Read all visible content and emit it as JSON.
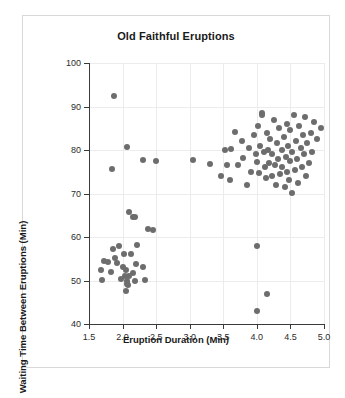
{
  "chart_data": {
    "type": "scatter",
    "title": "Old Faithful Eruptions",
    "xlabel": "Eruption Duration (Min)",
    "ylabel": "Waiting Time Between Eruptions (Min)",
    "xlim": [
      1.5,
      5.0
    ],
    "ylim": [
      40,
      100
    ],
    "xticks": [
      "1.5",
      "2.0",
      "2.5",
      "3.0",
      "3.5",
      "4.0",
      "4.5",
      "5.0"
    ],
    "xtick_values": [
      1.5,
      2.0,
      2.5,
      3.0,
      3.5,
      4.0,
      4.5,
      5.0
    ],
    "yticks": [
      "40",
      "50",
      "60",
      "70",
      "80",
      "90",
      "100"
    ],
    "ytick_values": [
      40,
      50,
      60,
      70,
      80,
      90,
      100
    ],
    "grid": true,
    "legend": "none",
    "marker_color": "#6d6d6d",
    "marker_size": 6,
    "series": [
      {
        "name": "Eruptions",
        "points": [
          [
            1.87,
            92.5
          ],
          [
            1.84,
            75.6
          ],
          [
            2.07,
            80.6
          ],
          [
            2.1,
            65.8
          ],
          [
            2.15,
            64.5
          ],
          [
            2.18,
            64.6
          ],
          [
            2.3,
            77.6
          ],
          [
            2.38,
            61.8
          ],
          [
            2.45,
            61.5
          ],
          [
            2.5,
            77.5
          ],
          [
            3.05,
            77.6
          ],
          [
            1.73,
            54.4
          ],
          [
            1.78,
            54.3
          ],
          [
            1.83,
            51.9
          ],
          [
            1.85,
            57.2
          ],
          [
            1.88,
            55.1
          ],
          [
            1.92,
            54.1
          ],
          [
            1.95,
            58.0
          ],
          [
            1.97,
            50.3
          ],
          [
            2.0,
            53.2
          ],
          [
            2.02,
            56.1
          ],
          [
            2.03,
            51.0
          ],
          [
            2.05,
            47.6
          ],
          [
            2.05,
            52.4
          ],
          [
            2.06,
            49.8
          ],
          [
            2.07,
            49.2
          ],
          [
            2.08,
            48.9
          ],
          [
            2.1,
            51.0
          ],
          [
            2.12,
            56.2
          ],
          [
            2.15,
            51.7
          ],
          [
            2.18,
            49.9
          ],
          [
            2.2,
            53.9
          ],
          [
            2.22,
            58.2
          ],
          [
            2.3,
            53.2
          ],
          [
            2.33,
            50.2
          ],
          [
            1.68,
            52.3
          ],
          [
            1.7,
            50.1
          ],
          [
            3.52,
            79.9
          ],
          [
            3.6,
            73.0
          ],
          [
            3.62,
            80.3
          ],
          [
            3.67,
            84.2
          ],
          [
            3.72,
            76.5
          ],
          [
            3.78,
            82.0
          ],
          [
            3.8,
            78.1
          ],
          [
            3.85,
            72.0
          ],
          [
            3.88,
            80.5
          ],
          [
            3.92,
            75.0
          ],
          [
            3.95,
            83.5
          ],
          [
            3.98,
            79.0
          ],
          [
            4.0,
            77.2
          ],
          [
            4.02,
            85.5
          ],
          [
            4.03,
            74.6
          ],
          [
            4.05,
            81.0
          ],
          [
            4.07,
            88.5
          ],
          [
            4.08,
            88.0
          ],
          [
            4.1,
            79.5
          ],
          [
            4.12,
            76.0
          ],
          [
            4.13,
            73.5
          ],
          [
            4.15,
            84.0
          ],
          [
            4.17,
            80.0
          ],
          [
            4.18,
            77.0
          ],
          [
            4.2,
            82.5
          ],
          [
            4.22,
            74.0
          ],
          [
            4.23,
            79.0
          ],
          [
            4.25,
            87.0
          ],
          [
            4.27,
            76.5
          ],
          [
            4.28,
            72.0
          ],
          [
            4.3,
            81.5
          ],
          [
            4.32,
            78.0
          ],
          [
            4.33,
            85.0
          ],
          [
            4.35,
            74.5
          ],
          [
            4.37,
            80.0
          ],
          [
            4.38,
            76.0
          ],
          [
            4.4,
            83.0
          ],
          [
            4.42,
            71.5
          ],
          [
            4.43,
            78.5
          ],
          [
            4.45,
            86.0
          ],
          [
            4.45,
            75.0
          ],
          [
            4.47,
            81.0
          ],
          [
            4.48,
            73.0
          ],
          [
            4.5,
            77.5
          ],
          [
            4.5,
            84.5
          ],
          [
            4.52,
            70.2
          ],
          [
            4.53,
            79.5
          ],
          [
            4.55,
            88.0
          ],
          [
            4.57,
            75.5
          ],
          [
            4.58,
            82.0
          ],
          [
            4.6,
            78.0
          ],
          [
            4.62,
            72.5
          ],
          [
            4.63,
            85.5
          ],
          [
            4.65,
            80.5
          ],
          [
            4.67,
            76.0
          ],
          [
            4.68,
            83.5
          ],
          [
            4.7,
            79.0
          ],
          [
            4.72,
            87.5
          ],
          [
            4.73,
            74.0
          ],
          [
            4.75,
            81.5
          ],
          [
            4.77,
            77.0
          ],
          [
            4.8,
            84.0
          ],
          [
            4.82,
            79.5
          ],
          [
            4.85,
            86.5
          ],
          [
            4.9,
            82.5
          ],
          [
            4.95,
            85.0
          ],
          [
            4.0,
            58.0
          ],
          [
            4.15,
            47.0
          ],
          [
            4.0,
            43.0
          ],
          [
            3.55,
            76.5
          ],
          [
            3.47,
            74.0
          ],
          [
            3.3,
            76.8
          ]
        ]
      }
    ]
  }
}
